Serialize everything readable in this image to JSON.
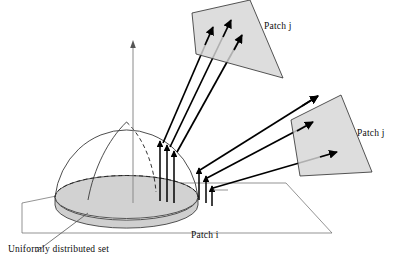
{
  "figure": {
    "labels": {
      "patch_j_top": "Patch j",
      "patch_j_right": "Patch j",
      "patch_i": "Patch i",
      "uniform_caption": "Uniformly distributed set"
    },
    "colors": {
      "patch_fill": "#d6d6d6",
      "patch_stroke": "#2b2b2b",
      "disk_fill": "#d2d2d2",
      "disk_stroke": "#2b2b2b",
      "dome_stroke": "#3a3a3a",
      "ground_stroke": "#555555",
      "axis_stroke": "#777777",
      "ray_stroke": "#000000",
      "background": "#ffffff"
    },
    "geometry": {
      "ground_plane": "20,204 120,184 285,184 330,232 20,232",
      "dome_center": [
        133,
        199
      ],
      "dome_radius_x": 65,
      "dome_radius_y": 22,
      "dome_height": 74,
      "axis_top": [
        133,
        42
      ],
      "axis_bottom": [
        133,
        203
      ],
      "vertical_rays_left": [
        160,
        167,
        174
      ],
      "vertical_rays_right": [
        200,
        207,
        212
      ],
      "long_rays_count": 6
    }
  }
}
